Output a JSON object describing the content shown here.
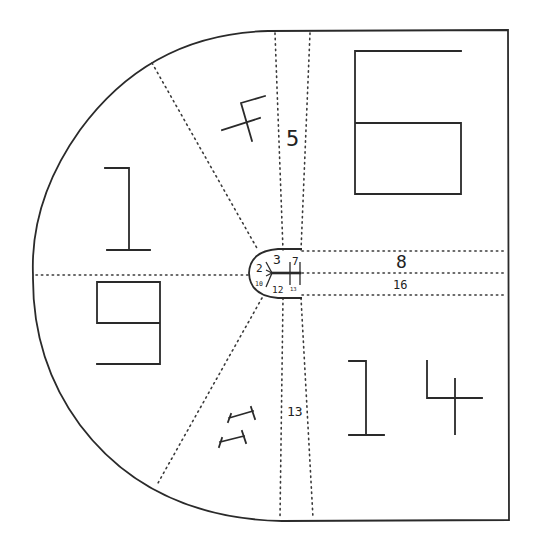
{
  "diagram": {
    "colors": {
      "line": "#2a2a2a",
      "background": "#ffffff"
    },
    "outline": {
      "top_y": 30,
      "bottom_y": 521,
      "right_x": 508,
      "arc_left_x": 32,
      "arc_start_x": 265
    },
    "dotted_dividers": [
      {
        "name": "upper-diagonal",
        "from": [
          152,
          63
        ],
        "to": [
          258,
          250
        ]
      },
      {
        "name": "lower-diagonal",
        "from": [
          262,
          298
        ],
        "to": [
          158,
          483
        ]
      },
      {
        "name": "left-horizontal",
        "from": [
          36,
          275
        ],
        "to": [
          248,
          275
        ]
      },
      {
        "name": "vertical-a-top",
        "from": [
          275,
          31
        ],
        "to": [
          283,
          250
        ]
      },
      {
        "name": "vertical-b-top",
        "from": [
          310,
          31
        ],
        "to": [
          301,
          250
        ]
      },
      {
        "name": "vertical-a-bottom",
        "from": [
          283,
          298
        ],
        "to": [
          280,
          520
        ]
      },
      {
        "name": "vertical-b-bottom",
        "from": [
          301,
          298
        ],
        "to": [
          313,
          520
        ]
      },
      {
        "name": "right-horizontal-1",
        "from": [
          302,
          251
        ],
        "to": [
          506,
          251
        ]
      },
      {
        "name": "right-horizontal-2",
        "from": [
          302,
          273
        ],
        "to": [
          506,
          273
        ]
      },
      {
        "name": "right-horizontal-3",
        "from": [
          302,
          295
        ],
        "to": [
          506,
          295
        ]
      }
    ],
    "zones": [
      {
        "id": "1",
        "label": "1",
        "style": "large-line-glyph",
        "position": [
          128,
          210
        ]
      },
      {
        "id": "4",
        "label": "4",
        "style": "large-line-glyph-rotated",
        "position": [
          245,
          118
        ]
      },
      {
        "id": "5",
        "label": "5",
        "style": "small-text",
        "position": [
          296,
          136
        ]
      },
      {
        "id": "6",
        "label": "6",
        "style": "large-line-glyph",
        "position": [
          408,
          122
        ]
      },
      {
        "id": "8",
        "label": "8",
        "style": "small-text",
        "position": [
          403,
          260
        ]
      },
      {
        "id": "9",
        "label": "9",
        "style": "large-line-glyph",
        "position": [
          128,
          322
        ]
      },
      {
        "id": "11",
        "label": "11",
        "style": "large-line-glyph-rotated",
        "position": [
          240,
          430
        ]
      },
      {
        "id": "13",
        "label": "13",
        "style": "small-text",
        "position": [
          298,
          411
        ]
      },
      {
        "id": "14",
        "label": "14",
        "style": "large-line-glyph",
        "position": [
          415,
          398
        ]
      },
      {
        "id": "16",
        "label": "16",
        "style": "small-text",
        "position": [
          403,
          285
        ]
      }
    ],
    "center_inset": {
      "labels": [
        {
          "label": "2",
          "position": [
            261,
            268
          ]
        },
        {
          "label": "3",
          "position": [
            278,
            259
          ]
        },
        {
          "label": "7",
          "position": [
            296,
            260
          ]
        },
        {
          "label": "10",
          "position": [
            261,
            283
          ]
        },
        {
          "label": "12",
          "position": [
            280,
            289
          ]
        },
        {
          "label": "13",
          "position": [
            297,
            288
          ]
        }
      ],
      "arrow": {
        "direction": "left",
        "tip": [
          272,
          273
        ],
        "tail": [
          300,
          273
        ]
      }
    }
  },
  "labels": {
    "z1": "1",
    "z4": "4",
    "z5": "5",
    "z6": "6",
    "z8": "8",
    "z9": "9",
    "z11": "11",
    "z13": "13",
    "z14": "14",
    "z16": "16",
    "c2": "2",
    "c3": "3",
    "c7": "7",
    "c10": "10",
    "c12": "12",
    "c13": "13"
  }
}
